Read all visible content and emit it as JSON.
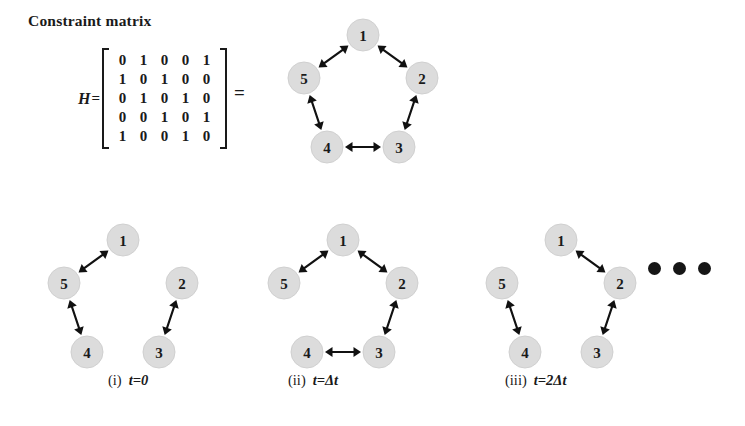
{
  "figure": {
    "matrix_section": {
      "title": "Constraint matrix",
      "label": "H",
      "equals": "=",
      "rows": [
        [
          "0",
          "1",
          "0",
          "0",
          "1"
        ],
        [
          "1",
          "0",
          "1",
          "0",
          "0"
        ],
        [
          "0",
          "1",
          "0",
          "1",
          "0"
        ],
        [
          "0",
          "0",
          "1",
          "0",
          "1"
        ],
        [
          "1",
          "0",
          "0",
          "1",
          "0"
        ]
      ],
      "equals_big": "="
    },
    "colors": {
      "node_fill": "#dcdcdc",
      "edge_stroke": "#111111",
      "text": "#1a1a1a",
      "background": "#ffffff"
    },
    "graphs": [
      {
        "id": "full-constraint-graph",
        "caption_index": "",
        "caption_time": "",
        "nodes": [
          {
            "id": "1",
            "label": "1",
            "cx": 83,
            "cy": 18
          },
          {
            "id": "2",
            "label": "2",
            "cx": 142,
            "cy": 61
          },
          {
            "id": "3",
            "label": "3",
            "cx": 119,
            "cy": 130
          },
          {
            "id": "4",
            "label": "4",
            "cx": 47,
            "cy": 130
          },
          {
            "id": "5",
            "label": "5",
            "cx": 24,
            "cy": 61
          }
        ],
        "edges": [
          {
            "from": "1",
            "to": "5"
          },
          {
            "from": "1",
            "to": "2"
          },
          {
            "from": "2",
            "to": "3"
          },
          {
            "from": "3",
            "to": "4"
          },
          {
            "from": "4",
            "to": "5"
          }
        ]
      },
      {
        "id": "graph-t0",
        "caption_index": "(i)",
        "caption_time": "t=0",
        "nodes": [
          {
            "id": "1",
            "label": "1",
            "cx": 83,
            "cy": 18
          },
          {
            "id": "2",
            "label": "2",
            "cx": 142,
            "cy": 61
          },
          {
            "id": "3",
            "label": "3",
            "cx": 119,
            "cy": 130
          },
          {
            "id": "4",
            "label": "4",
            "cx": 47,
            "cy": 130
          },
          {
            "id": "5",
            "label": "5",
            "cx": 24,
            "cy": 61
          }
        ],
        "edges": [
          {
            "from": "1",
            "to": "5"
          },
          {
            "from": "4",
            "to": "5"
          },
          {
            "from": "2",
            "to": "3"
          }
        ]
      },
      {
        "id": "graph-t-delta",
        "caption_index": "(ii)",
        "caption_time": "t=Δt",
        "nodes": [
          {
            "id": "1",
            "label": "1",
            "cx": 83,
            "cy": 18
          },
          {
            "id": "2",
            "label": "2",
            "cx": 142,
            "cy": 61
          },
          {
            "id": "3",
            "label": "3",
            "cx": 119,
            "cy": 130
          },
          {
            "id": "4",
            "label": "4",
            "cx": 47,
            "cy": 130
          },
          {
            "id": "5",
            "label": "5",
            "cx": 24,
            "cy": 61
          }
        ],
        "edges": [
          {
            "from": "1",
            "to": "5"
          },
          {
            "from": "1",
            "to": "2"
          },
          {
            "from": "2",
            "to": "3"
          },
          {
            "from": "3",
            "to": "4"
          }
        ]
      },
      {
        "id": "graph-t-2delta",
        "caption_index": "(iii)",
        "caption_time": "t=2Δt",
        "nodes": [
          {
            "id": "1",
            "label": "1",
            "cx": 83,
            "cy": 18
          },
          {
            "id": "2",
            "label": "2",
            "cx": 142,
            "cy": 61
          },
          {
            "id": "3",
            "label": "3",
            "cx": 119,
            "cy": 130
          },
          {
            "id": "4",
            "label": "4",
            "cx": 47,
            "cy": 130
          },
          {
            "id": "5",
            "label": "5",
            "cx": 24,
            "cy": 61
          }
        ],
        "edges": [
          {
            "from": "1",
            "to": "2"
          },
          {
            "from": "2",
            "to": "3"
          },
          {
            "from": "4",
            "to": "5"
          }
        ]
      }
    ],
    "ellipsis": "•••"
  }
}
